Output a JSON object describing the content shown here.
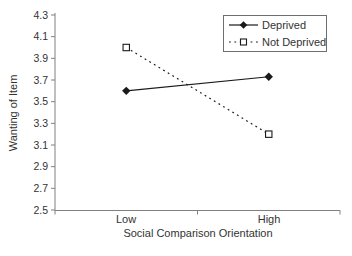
{
  "chart_data": {
    "type": "line",
    "categories": [
      "Low",
      "High"
    ],
    "series": [
      {
        "name": "Deprived",
        "values": [
          3.6,
          3.73
        ],
        "line_style": "solid",
        "marker": "filled-diamond",
        "color": "#1a1a1a"
      },
      {
        "name": "Not Deprived",
        "values": [
          4.0,
          3.2
        ],
        "line_style": "dotted",
        "marker": "open-square",
        "color": "#1a1a1a"
      }
    ],
    "title": "",
    "xlabel": "Social Comparison Orientation",
    "ylabel": "Wanting of Item",
    "ylim": [
      2.5,
      4.3
    ],
    "ytick_step": 0.2,
    "ytick_decimals": 1,
    "grid": false,
    "legend_position": "top-right",
    "axis_color": "#808080",
    "text_color": "#333333",
    "background_color": "#ffffff"
  }
}
